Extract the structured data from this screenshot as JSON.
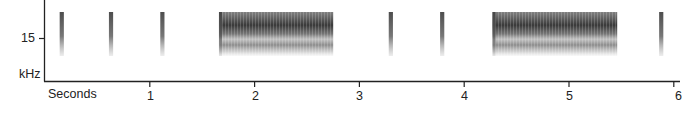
{
  "chart_data": {
    "type": "heatmap",
    "subtype": "spectrogram",
    "title": "",
    "xlabel": "Seconds",
    "ylabel": "kHz",
    "x_ticks": [
      1,
      2,
      3,
      4,
      5,
      6
    ],
    "y_ticks": [
      15
    ],
    "xlim": [
      0,
      6
    ],
    "grid": false,
    "legend": null,
    "colors": {
      "ink": "#222222",
      "signal_dark": "#3a3a3a",
      "background": "#ffffff"
    },
    "events": [
      {
        "kind": "pulse",
        "start_s": 0.14,
        "end_s": 0.18
      },
      {
        "kind": "pulse",
        "start_s": 0.61,
        "end_s": 0.65
      },
      {
        "kind": "pulse",
        "start_s": 1.1,
        "end_s": 1.14
      },
      {
        "kind": "buzz",
        "start_s": 1.66,
        "end_s": 2.75
      },
      {
        "kind": "pulse",
        "start_s": 3.28,
        "end_s": 3.32
      },
      {
        "kind": "pulse",
        "start_s": 3.77,
        "end_s": 3.81
      },
      {
        "kind": "buzz",
        "start_s": 4.27,
        "end_s": 5.46
      },
      {
        "kind": "pulse",
        "start_s": 5.86,
        "end_s": 5.9
      }
    ]
  },
  "labels": {
    "y_tick_15": "15",
    "y_unit": "kHz",
    "x_unit": "Seconds",
    "x_tick_1": "1",
    "x_tick_2": "2",
    "x_tick_3": "3",
    "x_tick_4": "4",
    "x_tick_5": "5",
    "x_tick_6": "6"
  }
}
